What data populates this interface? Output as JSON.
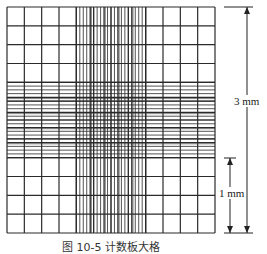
{
  "figure": {
    "caption": "图 10-5  计数板大格",
    "labels": {
      "large_span": "3 mm",
      "small_span": "1 mm"
    },
    "grid": {
      "x0": 7,
      "y0": 7,
      "x1": 215,
      "y1": 233,
      "large_cols": 12,
      "large_rows": 12,
      "center_start_index": 4,
      "center_end_index": 8,
      "center_medium_divisions": 5,
      "center_small_per_medium": 4,
      "line_color": "#2a2a2a"
    },
    "dimension_arrows": {
      "large": {
        "x": 247,
        "y_top": 7,
        "y_bottom": 233
      },
      "small": {
        "x": 230,
        "y_top": 158,
        "y_bottom": 233
      },
      "tick_x0": 224,
      "tick_x1": 253,
      "small_tick_x0": 224,
      "small_tick_x1": 236
    }
  }
}
